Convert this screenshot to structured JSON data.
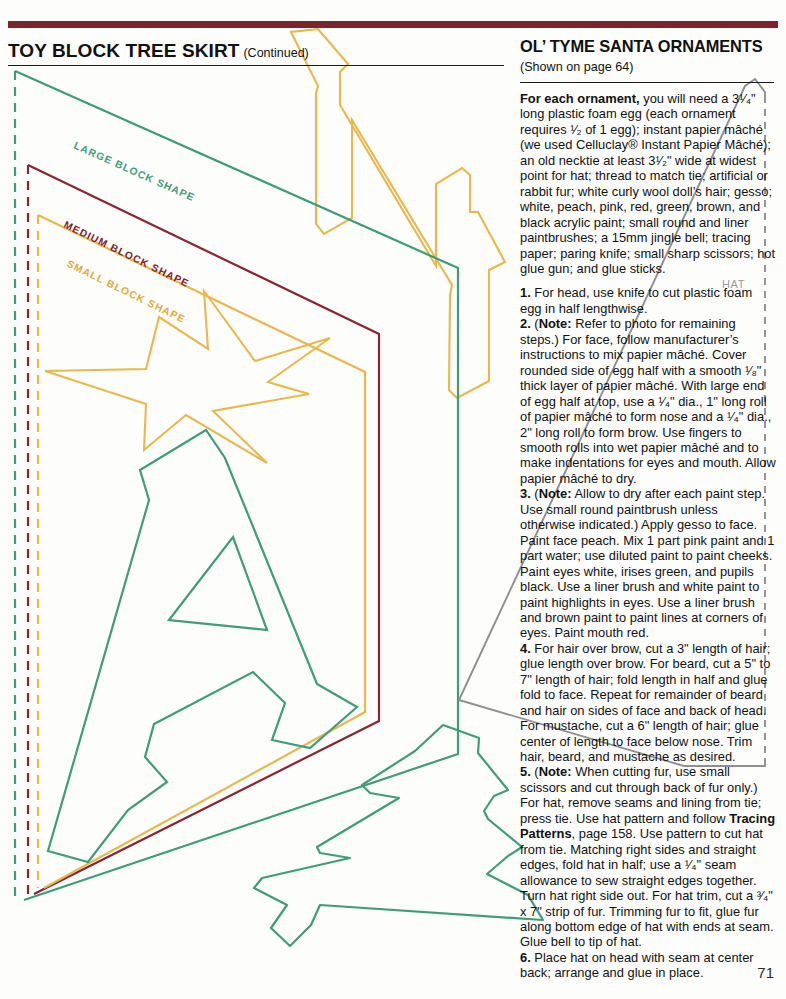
{
  "page": {
    "number": "71",
    "accent_maroon": "#7e2230",
    "accent_teal": "#3f9b7c",
    "accent_gold": "#e9b84c",
    "accent_gray": "#8f8f8f"
  },
  "left_column": {
    "title": "TOY BLOCK TREE SKIRT",
    "title_continued": "(Continued)",
    "pattern_labels": [
      {
        "text": "LARGE BLOCK SHAPE",
        "color": "#3f9b7c"
      },
      {
        "text": "MEDIUM BLOCK SHAPE",
        "color": "#7e2230"
      },
      {
        "text": "SMALL BLOCK SHAPE",
        "color": "#e0a93c"
      }
    ]
  },
  "right_column": {
    "title": "OL’ TYME SANTA ORNAMENTS",
    "subtitle": "(Shown on page 64)",
    "hat_label": "HAT",
    "materials_lead": "For each ornament,",
    "materials_body": " you will need a 3¹⁄₄\" long plastic foam egg (each ornament requires ¹⁄₂ of 1 egg); instant papier mâché (we used Celluclay® Instant Papier Mâché); an old necktie at least 3¹⁄₂\" wide at widest point for hat; thread to match tie; artificial or rabbit fur; white curly wool doll’s hair; gesso; white, peach, pink, red, green, brown, and black acrylic paint; small round and liner paintbrushes; a 15mm jingle bell; tracing paper; paring knife; small sharp scissors; hot glue gun; and glue sticks.",
    "steps": [
      {
        "number": "1.",
        "text": " For head, use knife to cut plastic foam egg in half lengthwise."
      },
      {
        "number": "2.",
        "note_label": "Note:",
        "text": " Refer to photo for remaining steps.) For face, follow manufacturer’s instructions to mix papier mâché. Cover rounded side of egg half with a smooth ¹⁄₈\" thick layer of papier mâché. With large end of egg half at top, use a ¹⁄₄\" dia., 1\" long roll of papier mâché to form nose and a ¹⁄₄\" dia., 2\" long roll to form brow. Use fingers to smooth rolls into wet papier mâché and to make indentations for eyes and mouth. Allow papier mâché to dry."
      },
      {
        "number": "3.",
        "note_label": "Note:",
        "text": " Allow to dry after each paint step. Use small round paintbrush unless otherwise indicated.) Apply gesso to face. Paint face peach. Mix 1 part pink paint and 1 part water; use diluted paint to paint cheeks. Paint eyes white, irises green, and pupils black. Use a liner brush and white paint to paint highlights in eyes. Use a liner brush and brown paint to paint lines at corners of eyes. Paint mouth red."
      },
      {
        "number": "4.",
        "text": " For hair over brow, cut a 3\" length of hair; glue length over brow. For beard, cut a 5\" to 7\" length of hair; fold length in half and glue fold to face. Repeat for remainder of beard and hair on sides of face and back of head. For mustache, cut a 6\" length of hair; glue center of length to face below nose. Trim hair, beard, and mustache as desired."
      },
      {
        "number": "5.",
        "note_label": "Note:",
        "text": " When cutting fur, use small scissors and cut through back of fur only.) For hat, remove seams and lining from tie; press tie. Use hat pattern and follow ",
        "ref_label": "Tracing Patterns",
        "text_after": ", page 158. Use pattern to cut hat from tie. Matching right sides and straight edges, fold hat in half; use a ¹⁄₄\" seam allowance to sew straight edges together. Turn hat right side out. For hat trim, cut a ³⁄₄\" x 7\" strip of fur. Trimming fur to fit, glue fur along bottom edge of hat with ends at seam. Glue bell to tip of hat."
      },
      {
        "number": "6.",
        "text": " Place hat on head with seam at center back; arrange and glue in place."
      }
    ]
  }
}
